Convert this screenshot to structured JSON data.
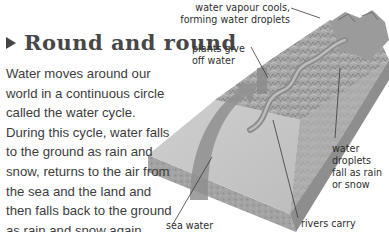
{
  "section": {
    "title": "Round and round",
    "title_icon": "triangle-right-icon",
    "body": "Water moves around our world in a continuous circle called the water cycle. During this cycle, water falls to the ground as rain and snow, returns to the air from the sea and the land and then falls back to the ground as rain and snow again."
  },
  "illustration": {
    "description": "3D cutaway block of landscape showing the water cycle",
    "labels": {
      "vapour_line1": "water vapour cools,",
      "vapour_line2": "forming water droplets",
      "plants_line1": "plants give",
      "plants_line2": "off water",
      "droplets_line1": "water",
      "droplets_line2": "droplets",
      "droplets_line3": "fall as rain",
      "droplets_line4": "or snow",
      "sea": "sea water",
      "rivers": "rivers carry"
    }
  }
}
